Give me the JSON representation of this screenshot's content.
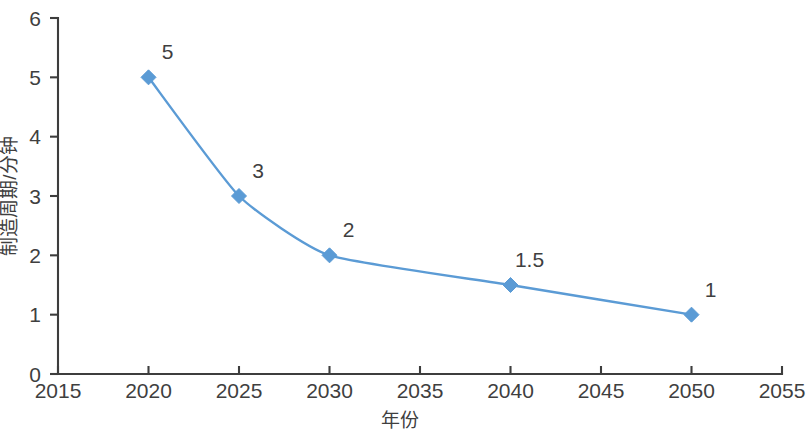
{
  "chart_data": {
    "type": "line",
    "title": "",
    "subtitle": "",
    "xlabel": "年份",
    "ylabel": "制造周期/分钟",
    "x": [
      2020,
      2025,
      2030,
      2040,
      2050
    ],
    "values": [
      5,
      3,
      2,
      1.5,
      1
    ],
    "point_labels": [
      "5",
      "3",
      "2",
      "1.5",
      "1"
    ],
    "series": [
      {
        "name": "制造周期",
        "x": [
          2020,
          2025,
          2030,
          2040,
          2050
        ],
        "values": [
          5,
          3,
          2,
          1.5,
          1
        ],
        "color": "#5b9bd5",
        "marker": "diamond",
        "smooth": true
      }
    ],
    "xlim": [
      2015,
      2055
    ],
    "ylim": [
      0,
      6
    ],
    "xticks": [
      2015,
      2020,
      2025,
      2030,
      2035,
      2040,
      2045,
      2050,
      2055
    ],
    "xtick_labels": [
      "2015",
      "2020",
      "2025",
      "2030",
      "2035",
      "2040",
      "2045",
      "2050",
      "2055"
    ],
    "yticks": [
      0,
      1,
      2,
      3,
      4,
      5,
      6
    ],
    "ytick_labels": [
      "0",
      "1",
      "2",
      "3",
      "4",
      "5",
      "6"
    ],
    "grid": false,
    "legend": false,
    "legend_position": "none",
    "annotations": []
  },
  "style": {
    "background": "#ffffff",
    "axis_color": "#3d3d3d",
    "text_color": "#3f3f3f",
    "series_color": "#5b9bd5",
    "marker_color": "#5b9bd5"
  }
}
